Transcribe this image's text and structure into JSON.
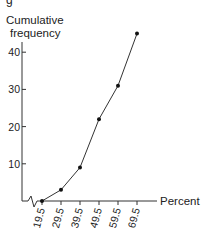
{
  "figure": {
    "caption_fragment": "g"
  },
  "chart_data": {
    "type": "line",
    "title": "",
    "ylabel": "Cumulative frequency",
    "xlabel": "Percent",
    "x": [
      19.5,
      29.5,
      39.5,
      49.5,
      59.5,
      69.5
    ],
    "series": [
      {
        "name": "Cumulative frequency",
        "values": [
          0,
          3,
          9,
          22,
          31,
          45
        ]
      }
    ],
    "xticks": [
      "19.5",
      "29.5",
      "39.5",
      "49.5",
      "59.5",
      "69.5"
    ],
    "yticks": [
      "10",
      "20",
      "30",
      "40"
    ],
    "ylim": [
      0,
      47
    ],
    "axis_break": true,
    "grid": false,
    "markers": true
  }
}
